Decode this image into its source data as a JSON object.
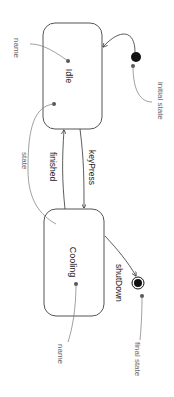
{
  "diagram": {
    "type": "uml-state-machine",
    "orientation": "rotated-90-clockwise",
    "states": [
      {
        "id": "idle",
        "name": "Idle"
      },
      {
        "id": "cooling",
        "name": "Cooling"
      }
    ],
    "transitions": [
      {
        "from": "initial",
        "to": "idle",
        "label": ""
      },
      {
        "from": "idle",
        "to": "cooling",
        "label": "keyPress"
      },
      {
        "from": "cooling",
        "to": "idle",
        "label": "finished"
      },
      {
        "from": "cooling",
        "to": "final",
        "label": "shutDown"
      }
    ],
    "annotations": {
      "idle_name": "name",
      "state": "state",
      "initial_state": "initial state",
      "cooling_name": "name",
      "final_state": "final state"
    }
  },
  "colors": {
    "stroke": "#333333",
    "annotation": "#777777",
    "dot": "#555555"
  }
}
